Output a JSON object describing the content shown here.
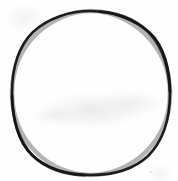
{
  "image": {
    "kind": "scanned-drawing",
    "subject": "hand-drawn circle outline",
    "alt_text": "A single hand-drawn circle outline in dark ink on white paper",
    "width_px": 178,
    "height_px": 181,
    "background_color": "#fefefe",
    "paper_color": "#fefefe"
  },
  "shapes": {
    "circle": {
      "label": "circle",
      "stroke_color": "#1c1c1c",
      "fill_color": "none",
      "stroke_width_px": 2.6,
      "center_x_px": 91,
      "center_y_px": 93,
      "radius_x_px": 79,
      "radius_y_px": 82,
      "left_edge_px": 12,
      "right_edge_px": 170,
      "top_edge_px": 11,
      "bottom_edge_px": 175
    }
  },
  "artifacts": {
    "ghosting_label": "faint scanner ghosting",
    "speck_label": "paper speck"
  }
}
